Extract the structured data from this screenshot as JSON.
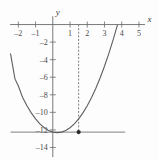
{
  "figure": {
    "background_color": "#fdfdfd",
    "axis_color": "#6b6b6b",
    "curve_color": "#5e5e5e",
    "guide_color": "#707070",
    "point_color": "#2b2b2b"
  },
  "axis_names": {
    "x": "x",
    "y": "y"
  },
  "chart_data": {
    "type": "line",
    "title": "",
    "subtitle": "",
    "xlabel": "x",
    "ylabel": "y",
    "grid": false,
    "legend": "none",
    "xlim": [
      -2.6,
      5.7
    ],
    "ylim": [
      -15.2,
      1.2
    ],
    "x_ticks": [
      -2,
      -1,
      1,
      2,
      3,
      4,
      5
    ],
    "x_tick_labels": [
      "-2",
      "-1",
      "1",
      "2",
      "3",
      "4",
      "5"
    ],
    "y_ticks": [
      -2,
      -4,
      -6,
      -8,
      -10,
      -12,
      -14
    ],
    "y_tick_labels": [
      "-2",
      "-4",
      "-6",
      "-8",
      "-10",
      "-12",
      "-14"
    ],
    "series": [
      {
        "name": "parabola",
        "kind": "curve",
        "equation": "y = (x + 2)(x - 5)",
        "x": [
          -2.45,
          -2.2,
          -2.0,
          -1.75,
          -1.5,
          -1.25,
          -1.0,
          -0.75,
          -0.5,
          -0.25,
          0,
          0.25,
          0.5,
          0.75,
          1.0,
          1.25,
          1.5,
          1.75,
          2.0,
          2.25,
          2.5,
          2.75,
          3.0,
          3.25,
          3.5,
          3.75,
          4.0,
          4.25,
          4.5,
          4.75,
          5.0,
          5.25
        ],
        "values": [
          -3.3375,
          -6.16,
          -7.0,
          -8.3125,
          -9.25,
          -10.0625,
          -10.75,
          -11.3125,
          -11.75,
          -12.0625,
          -12.25,
          -12.3125,
          -12.25,
          -12.0625,
          -11.75,
          -11.3125,
          -10.75,
          -10.0625,
          -9.25,
          -8.3125,
          -7.25,
          -6.0625,
          -4.75,
          -3.3125,
          -1.75,
          -0.0625,
          1.75,
          3.6875,
          5.75,
          7.9375,
          10.25,
          12.6875
        ]
      }
    ],
    "annotations": [
      {
        "name": "vertex-point",
        "kind": "point",
        "x": 1.5,
        "y": -12.25,
        "label": ""
      },
      {
        "name": "axis-of-symmetry",
        "kind": "vertical-dashed-line",
        "x": 1.5,
        "y_from": 0,
        "y_to": -12.25
      },
      {
        "name": "minimum-value-line",
        "kind": "horizontal-solid-line",
        "y": -12.25,
        "x_from": -2.45,
        "x_to": 4.2
      }
    ],
    "x_intercepts": [
      -2,
      5
    ],
    "y_intercept": -10,
    "vertex": [
      1.5,
      -12.25
    ]
  }
}
